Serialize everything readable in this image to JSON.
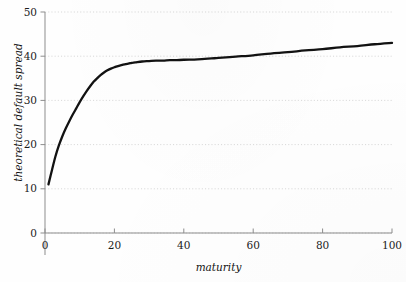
{
  "figure": {
    "background_color": "#fefefe",
    "curve_color": "#121212",
    "grid_color": "#c9c9c9",
    "axis_color": "#8d8d8d",
    "cropped_title_fragment": ""
  },
  "chart_data": {
    "type": "line",
    "title": "",
    "subtitle": "",
    "xlabel": "maturity",
    "ylabel": "theoretical default spread",
    "xlim": [
      0,
      100
    ],
    "ylim": [
      0,
      50
    ],
    "xticks": [
      0,
      20,
      40,
      60,
      80,
      100
    ],
    "yticks": [
      0,
      10,
      20,
      30,
      40,
      50
    ],
    "xticklabels": [
      "0",
      "20",
      "40",
      "60",
      "80",
      "100"
    ],
    "yticklabels": [
      "0",
      "10",
      "20",
      "30",
      "40",
      "50"
    ],
    "grid": true,
    "grid_axis": "y",
    "grid_style": "dotted",
    "legend": null,
    "legend_position": "none",
    "annotations": [],
    "series": [
      {
        "name": "theoretical default spread",
        "color": "#121212",
        "linewidth": 2.3,
        "x": [
          1,
          2,
          3,
          4,
          5,
          6,
          7,
          8,
          9,
          10,
          11,
          12,
          13,
          14,
          15,
          16,
          17,
          18,
          19,
          20,
          22,
          24,
          25,
          26,
          28,
          30,
          32,
          34,
          36,
          38,
          40,
          44,
          48,
          50,
          55,
          60,
          65,
          70,
          75,
          80,
          85,
          90,
          95,
          100
        ],
        "y": [
          11.0,
          14.2,
          17.3,
          19.8,
          21.9,
          23.7,
          25.3,
          26.8,
          28.2,
          29.6,
          30.9,
          32.1,
          33.2,
          34.2,
          35.0,
          35.7,
          36.3,
          36.8,
          37.2,
          37.5,
          38.0,
          38.3,
          38.5,
          38.6,
          38.8,
          38.9,
          39.0,
          39.0,
          39.1,
          39.1,
          39.2,
          39.3,
          39.5,
          39.6,
          39.9,
          40.2,
          40.6,
          40.9,
          41.3,
          41.6,
          42.0,
          42.3,
          42.7,
          43.0
        ]
      }
    ]
  },
  "axes_geometry": {
    "left_px": 45,
    "right_px": 392,
    "bottom_px": 233,
    "top_px": 12
  }
}
